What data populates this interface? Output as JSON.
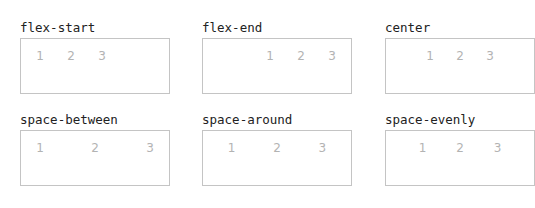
{
  "demos": [
    {
      "label": "flex-start",
      "items": [
        "1",
        "2",
        "3"
      ]
    },
    {
      "label": "flex-end",
      "items": [
        "1",
        "2",
        "3"
      ]
    },
    {
      "label": "center",
      "items": [
        "1",
        "2",
        "3"
      ]
    },
    {
      "label": "space-between",
      "items": [
        "1",
        "2",
        "3"
      ]
    },
    {
      "label": "space-around",
      "items": [
        "1",
        "2",
        "3"
      ]
    },
    {
      "label": "space-evenly",
      "items": [
        "1",
        "2",
        "3"
      ]
    }
  ],
  "colors": {
    "label_text": "#222222",
    "item_text": "#b3b3b3",
    "box_border": "#c4c4c4",
    "background": "#ffffff"
  }
}
